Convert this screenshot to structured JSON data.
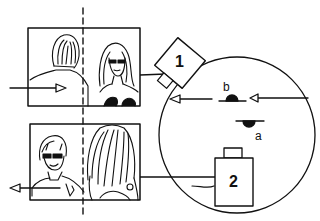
{
  "diagram": {
    "type": "180-degree-rule camera setup",
    "cameras": [
      {
        "id": "camera-1",
        "label": "1"
      },
      {
        "id": "camera-2",
        "label": "2"
      }
    ],
    "actors": [
      {
        "id": "actor-a",
        "label": "a"
      },
      {
        "id": "actor-b",
        "label": "b"
      }
    ],
    "frames": [
      {
        "id": "frame-camera-1",
        "description": "Shot from camera 1: man from behind (left), woman with sunglasses facing (right); arrow moving right"
      },
      {
        "id": "frame-camera-2",
        "description": "Shot from camera 2: man with sunglasses facing (left), woman with long hair from behind (right); arrow moving left"
      }
    ],
    "axis": {
      "style": "dashed vertical line",
      "meaning": "screen center / line of action"
    },
    "colors": {
      "ink": "#111111",
      "background": "#ffffff"
    }
  }
}
